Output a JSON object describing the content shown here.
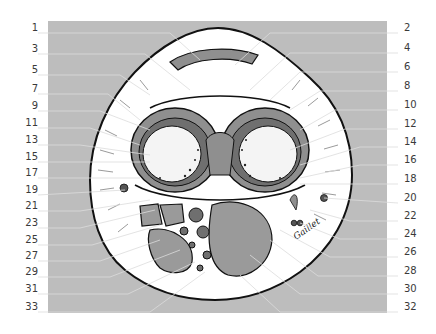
{
  "figure": {
    "type": "anatomical cross-section illustration",
    "signature": "Gaillet",
    "background_color": "#bdbdbd",
    "tissue_fill": "#ffffff",
    "muscle_color": "#8f8f8f",
    "outline_color": "#111111"
  },
  "labels": {
    "left": [
      {
        "text": "1",
        "y": 28
      },
      {
        "text": "3",
        "y": 49
      },
      {
        "text": "5",
        "y": 70
      },
      {
        "text": "7",
        "y": 89
      },
      {
        "text": "9",
        "y": 106
      },
      {
        "text": "11",
        "y": 123
      },
      {
        "text": "13",
        "y": 140
      },
      {
        "text": "15",
        "y": 157
      },
      {
        "text": "17",
        "y": 173
      },
      {
        "text": "19",
        "y": 190
      },
      {
        "text": "21",
        "y": 206
      },
      {
        "text": "23",
        "y": 223
      },
      {
        "text": "25",
        "y": 240
      },
      {
        "text": "27",
        "y": 256
      },
      {
        "text": "29",
        "y": 272
      },
      {
        "text": "31",
        "y": 289
      },
      {
        "text": "33",
        "y": 307
      }
    ],
    "right": [
      {
        "text": "2",
        "y": 28
      },
      {
        "text": "4",
        "y": 48
      },
      {
        "text": "6",
        "y": 67
      },
      {
        "text": "8",
        "y": 86
      },
      {
        "text": "10",
        "y": 105
      },
      {
        "text": "12",
        "y": 124
      },
      {
        "text": "14",
        "y": 142
      },
      {
        "text": "16",
        "y": 160
      },
      {
        "text": "18",
        "y": 179
      },
      {
        "text": "20",
        "y": 198
      },
      {
        "text": "22",
        "y": 216
      },
      {
        "text": "24",
        "y": 234
      },
      {
        "text": "26",
        "y": 252
      },
      {
        "text": "28",
        "y": 271
      },
      {
        "text": "30",
        "y": 289
      },
      {
        "text": "32",
        "y": 307
      }
    ]
  }
}
